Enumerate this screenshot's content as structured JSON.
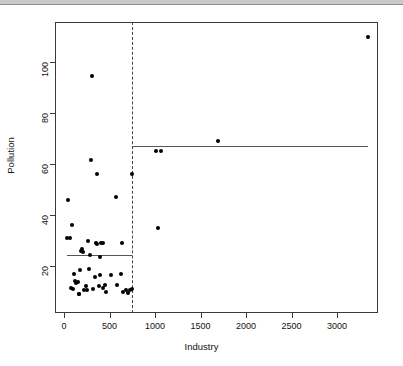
{
  "figure": {
    "name": "pollution-vs-industry-regression-tree-scatter",
    "background": "#ffffff",
    "point_color": "#000000",
    "line_color": "#555555",
    "split_line_color": "#444444"
  },
  "chart_data": {
    "type": "scatter",
    "title": "",
    "xlabel": "Industry",
    "ylabel": "Pollution",
    "xlim": [
      -130,
      3420
    ],
    "ylim": [
      4,
      118
    ],
    "xticks": [
      0,
      500,
      1000,
      1500,
      2000,
      2500,
      3000
    ],
    "xticklabels": [
      "0",
      "500",
      "1000",
      "1500",
      "2000",
      "2500",
      "3000"
    ],
    "yticks": [
      20,
      40,
      60,
      80,
      100
    ],
    "yticklabels": [
      "20",
      "40",
      "60",
      "80",
      "100"
    ],
    "grid": false,
    "legend": null,
    "x": [
      35,
      46,
      61,
      80,
      91,
      100,
      115,
      125,
      136,
      150,
      161,
      170,
      181,
      190,
      200,
      213,
      225,
      237,
      250,
      262,
      275,
      287,
      300,
      310,
      320,
      337,
      347,
      360,
      368,
      380,
      391,
      400,
      412,
      425,
      434,
      447,
      460,
      520,
      569,
      586,
      625,
      641,
      653,
      680,
      699,
      720,
      744,
      748,
      1007,
      1033,
      1064,
      1692,
      3344
    ],
    "y": [
      31,
      46,
      31,
      11.5,
      36,
      11,
      17,
      14,
      13.5,
      13.6,
      9,
      9,
      18.5,
      26,
      26.5,
      25.5,
      10.5,
      12,
      10.5,
      30,
      19,
      24.5,
      61.5,
      94.5,
      11,
      15.5,
      29,
      28.5,
      56,
      12,
      23.5,
      16.5,
      29,
      29,
      11.5,
      12.5,
      10,
      16.5,
      47,
      12.5,
      17,
      29,
      10,
      10.5,
      9.5,
      10.5,
      11,
      56,
      65,
      35,
      65,
      69,
      110
    ],
    "annotations": [
      {
        "name": "split-threshold",
        "kind": "vertical-dashed-line",
        "x": 748,
        "label": "Industry = 748"
      },
      {
        "name": "left-node-mean",
        "kind": "horizontal-step-segment",
        "y": 24.5,
        "x_start": 35,
        "x_end": 748,
        "label": "mean Pollution = 24.5"
      },
      {
        "name": "right-node-mean",
        "kind": "horizontal-step-segment",
        "y": 67,
        "x_start": 748,
        "x_end": 3344,
        "label": "mean Pollution = 67"
      }
    ]
  }
}
